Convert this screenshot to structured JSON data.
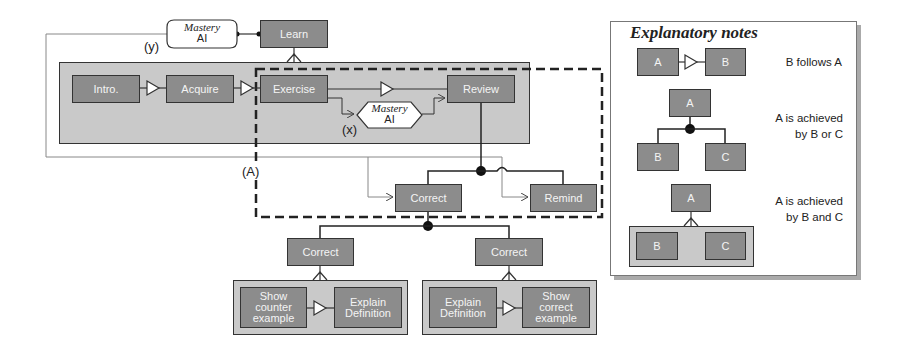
{
  "diagram": {
    "top": {
      "learn": "Learn",
      "mastery_y": {
        "line1": "Mastery",
        "line2": "AI"
      },
      "label_y": "(y)"
    },
    "sequence": {
      "intro": "Intro.",
      "acquire": "Acquire",
      "exercise": "Exercise",
      "review": "Review",
      "mastery_x": {
        "line1": "Mastery",
        "line2": "AI"
      },
      "label_x": "(x)"
    },
    "region_label": "(A)",
    "review_children": {
      "correct": "Correct",
      "remind": "Remind"
    },
    "correct_options": [
      {
        "parent": "Correct",
        "steps": [
          "Show\ncounter\nexample",
          "Explain\nDefinition"
        ]
      },
      {
        "parent": "Correct",
        "steps": [
          "Explain\nDefinition",
          "Show\ncorrect\nexample"
        ]
      }
    ]
  },
  "notes": {
    "title": "Explanatory notes",
    "items": [
      {
        "a": "A",
        "b": "B",
        "text": "B follows A"
      },
      {
        "a": "A",
        "b": "B",
        "c": "C",
        "text": "A is achieved\nby B or C"
      },
      {
        "a": "A",
        "b": "B",
        "c": "C",
        "text": "A is achieved\nby B and C"
      }
    ]
  },
  "colors": {
    "node_fill": "#8c8c8c",
    "node_border": "#333333",
    "group_fill": "#c9c9c9",
    "node_text": "#f4f4f4"
  }
}
